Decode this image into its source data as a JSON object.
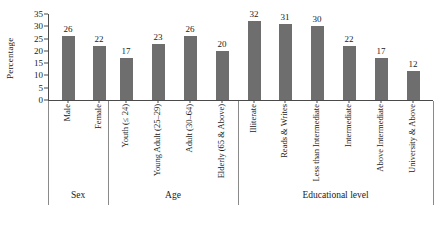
{
  "chart_data": {
    "type": "bar",
    "title": "",
    "xlabel": "",
    "ylabel": "Percentage",
    "ylim": [
      0,
      35
    ],
    "ytick_step": 5,
    "yticks": [
      "35",
      "30",
      "25",
      "20",
      "15",
      "10",
      "5",
      "0"
    ],
    "grid": false,
    "legend": "none",
    "bar_color": "#6e6e6e",
    "categories": [
      "Male",
      "Female",
      "Youth (≤ 24)",
      "Young Adult (25–29)",
      "Adult (30–64)",
      "Elderly (65 & Above)",
      "Illiterate",
      "Reads & Writes",
      "Less than Intermediate",
      "Intermediate",
      "Above Intermediate",
      "University & Above"
    ],
    "values": [
      26,
      22,
      17,
      23,
      26,
      20,
      32,
      31,
      30,
      22,
      17,
      12
    ],
    "groups": [
      {
        "label": "Sex",
        "start": 0,
        "end": 1
      },
      {
        "label": "Age",
        "start": 2,
        "end": 5
      },
      {
        "label": "Educational level",
        "start": 6,
        "end": 11
      }
    ]
  }
}
